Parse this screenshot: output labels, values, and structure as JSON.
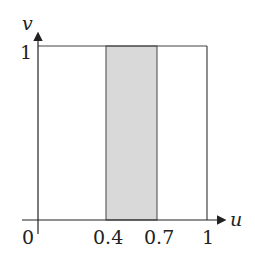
{
  "diagram": {
    "axes": {
      "x_label": "u",
      "y_label": "v"
    },
    "x_ticks": [
      {
        "value": 0,
        "label": "0"
      },
      {
        "value": 0.4,
        "label": "0.4"
      },
      {
        "value": 0.7,
        "label": "0.7"
      },
      {
        "value": 1,
        "label": "1"
      }
    ],
    "y_ticks": [
      {
        "value": 1,
        "label": "1"
      }
    ],
    "square": {
      "u_range": [
        0,
        1
      ],
      "v_range": [
        0,
        1
      ]
    },
    "shaded_region": {
      "u_range": [
        0.4,
        0.7
      ],
      "v_range": [
        0,
        1
      ],
      "color": "#d9d9d9"
    },
    "colors": {
      "line": "#333333",
      "shade": "#d9d9d9"
    }
  }
}
